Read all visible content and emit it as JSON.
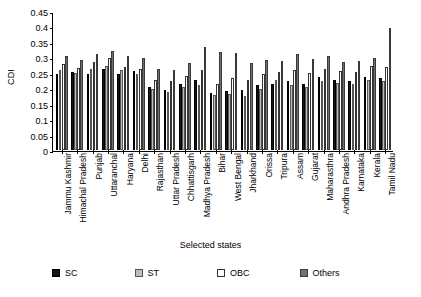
{
  "chart_data": {
    "type": "bar",
    "title": "",
    "xlabel": "Selected states",
    "ylabel": "CDI",
    "ylim": [
      0,
      0.45
    ],
    "ytick_values": [
      0,
      0.05,
      0.1,
      0.15,
      0.2,
      0.25,
      0.3,
      0.35,
      0.4,
      0.45
    ],
    "ytick_labels": [
      "0",
      "0.05",
      "0.1",
      "0.15",
      "0.2",
      "0.25",
      "0.3",
      "0.35",
      "0.4",
      "0.45"
    ],
    "grid": false,
    "legend_position": "bottom",
    "categories": [
      "Jammu Kashmir",
      "Himachal Pradesh",
      "Punjab",
      "Uttaranchal",
      "Haryana",
      "Delhi",
      "Rajasthan",
      "Uttar Pradesh",
      "Chhattisgarh",
      "Madhya Pradesh",
      "Bihar",
      "West Bengal",
      "Jharkhand",
      "Orissa",
      "Tripura",
      "Assam",
      "Gujarat",
      "Maharasthra",
      "Andhra Pradesh",
      "Karnataka",
      "Kerala",
      "Tamil Nadu"
    ],
    "series": [
      {
        "name": "SC",
        "color": "#151515",
        "values": [
          0.245,
          0.252,
          0.245,
          0.263,
          0.245,
          0.255,
          0.205,
          0.195,
          0.215,
          0.228,
          0.185,
          0.19,
          0.193,
          0.212,
          0.215,
          0.225,
          0.215,
          0.235,
          0.228,
          0.222,
          0.238,
          0.232
        ]
      },
      {
        "name": "ST",
        "color": "#bdbdbd",
        "values": [
          0.258,
          0.248,
          0.262,
          0.272,
          0.258,
          0.246,
          0.197,
          0.188,
          0.205,
          0.212,
          0.178,
          0.182,
          0.175,
          0.198,
          0.228,
          0.212,
          0.205,
          0.222,
          0.218,
          0.215,
          0.228,
          0.222
        ]
      },
      {
        "name": "OBC",
        "color": "#ffffff",
        "values": [
          0.278,
          0.265,
          0.285,
          0.298,
          0.268,
          0.262,
          0.228,
          0.222,
          0.24,
          0.258,
          0.215,
          0.232,
          0.228,
          0.245,
          0.252,
          0.258,
          0.248,
          0.262,
          0.255,
          0.252,
          0.272,
          0.268
        ]
      },
      {
        "name": "Others",
        "color": "#707070",
        "values": [
          0.305,
          0.292,
          0.312,
          0.322,
          0.305,
          0.298,
          0.262,
          0.258,
          0.282,
          0.335,
          0.318,
          0.315,
          0.282,
          0.292,
          0.288,
          0.312,
          0.295,
          0.305,
          0.285,
          0.288,
          0.298,
          0.395
        ]
      }
    ]
  },
  "legend": {
    "items": [
      {
        "label": "SC"
      },
      {
        "label": "ST"
      },
      {
        "label": "OBC"
      },
      {
        "label": "Others"
      }
    ]
  }
}
